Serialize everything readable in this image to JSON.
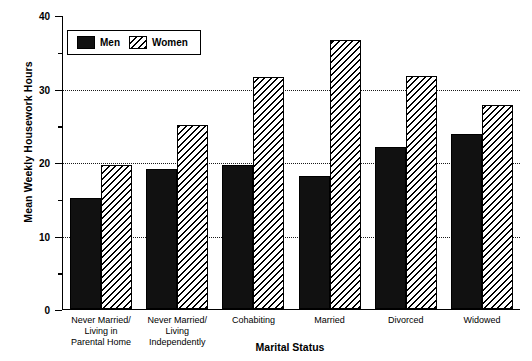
{
  "chart_data": {
    "type": "bar",
    "title": "",
    "xlabel": "Marital Status",
    "ylabel": "Mean Weekly Housework Hours",
    "ylim": [
      0,
      40
    ],
    "yticks": [
      0,
      10,
      20,
      30,
      40
    ],
    "ytick_labels": [
      "0",
      "10",
      "20",
      "30",
      "40"
    ],
    "yminor_ticks": [
      5,
      15,
      25,
      35
    ],
    "gridlines": [
      10,
      20,
      30
    ],
    "grid": true,
    "legend_position": "upper-left-inside",
    "categories": [
      "Never Married/\nLiving in\nParental Home",
      "Never Married/\nLiving\nIndependently",
      "Cohabiting",
      "Married",
      "Divorced",
      "Widowed"
    ],
    "category_lines": [
      [
        "Never Married/",
        "Living in",
        "Parental Home"
      ],
      [
        "Never Married/",
        "Living",
        "Independently"
      ],
      [
        "Cohabiting"
      ],
      [
        "Married"
      ],
      [
        "Divorced"
      ],
      [
        "Widowed"
      ]
    ],
    "series": [
      {
        "name": "Men",
        "fill": "solid",
        "color": "#111111",
        "values": [
          15.0,
          19.0,
          19.5,
          18.0,
          22.0,
          23.8
        ]
      },
      {
        "name": "Women",
        "fill": "diagonal-hatch",
        "color": "#000000",
        "values": [
          19.5,
          25.0,
          31.5,
          36.5,
          31.6,
          27.7
        ]
      }
    ]
  },
  "legend": {
    "items": [
      {
        "label": "Men",
        "swatch": "solid-black-swatch"
      },
      {
        "label": "Women",
        "swatch": "hatched-swatch"
      }
    ]
  },
  "caption": {
    "remnant": ""
  }
}
